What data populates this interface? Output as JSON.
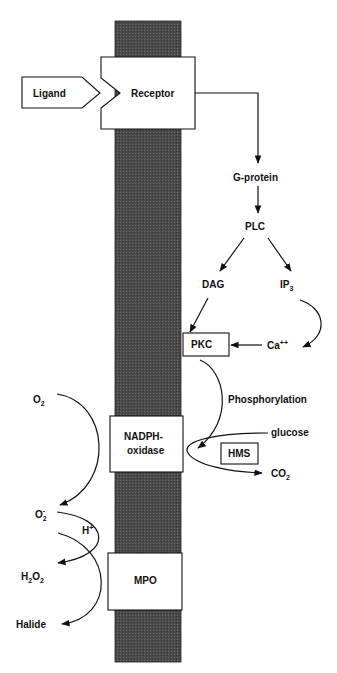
{
  "diagram": {
    "membrane": {
      "color": "#4a4a4a"
    },
    "nodes": {
      "ligand": "Ligand",
      "receptor": "Receptor",
      "g_protein": "G-protein",
      "plc": "PLC",
      "dag": "DAG",
      "ip3": {
        "base": "IP",
        "sub": "3"
      },
      "pkc": "PKC",
      "calcium": {
        "base": "Ca",
        "sup": "++"
      },
      "phosphorylation": "Phosphorylation",
      "nadph_oxidase": {
        "line1": "NADPH-",
        "line2": "oxidase"
      },
      "glucose": "glucose",
      "hms": "HMS",
      "co2": {
        "base": "CO",
        "sub": "2"
      },
      "o2": {
        "base": "O",
        "sub": "2"
      },
      "superoxide": {
        "base": "O",
        "sub": "2",
        "sup": "-"
      },
      "h_plus": {
        "base": "H",
        "sup": "+"
      },
      "h2o2": {
        "a": "H",
        "sub1": "2",
        "b": "O",
        "sub2": "2"
      },
      "mpo": "MPO",
      "halide": "Halide"
    }
  }
}
